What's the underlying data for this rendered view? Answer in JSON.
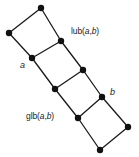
{
  "figure": {
    "background_color": "#ffffff",
    "edge_color": "#1a1a1a",
    "node_color": "#111111",
    "node_radius": 3.2,
    "edge_width": 1.3
  },
  "labels": {
    "lub": {
      "prefix": "lub(",
      "var1": "a",
      "sep": ",",
      "var2": "b",
      "suffix": ")",
      "full": "lub(a,b)"
    },
    "glb": {
      "prefix": "glb(",
      "var1": "a",
      "sep": ",",
      "var2": "b",
      "suffix": ")",
      "full": "glb(a,b)"
    },
    "a": {
      "text": "a"
    },
    "b": {
      "text": "b"
    }
  },
  "chart_data": {
    "type": "diagram",
    "subtype": "hasse-lattice",
    "title": "",
    "nodes": [
      {
        "id": "top",
        "x": 41,
        "y": 8,
        "label": ""
      },
      {
        "id": "upleft",
        "x": 9,
        "y": 33,
        "label": ""
      },
      {
        "id": "lub",
        "x": 61,
        "y": 41,
        "label": "lub(a,b)"
      },
      {
        "id": "a",
        "x": 32,
        "y": 58,
        "label": "a"
      },
      {
        "id": "midright",
        "x": 83,
        "y": 70,
        "label": ""
      },
      {
        "id": "midleft",
        "x": 55,
        "y": 89,
        "label": ""
      },
      {
        "id": "b",
        "x": 102,
        "y": 97,
        "label": "b"
      },
      {
        "id": "glb",
        "x": 78,
        "y": 118,
        "label": "glb(a,b)"
      },
      {
        "id": "right",
        "x": 128,
        "y": 127,
        "label": ""
      },
      {
        "id": "bottom",
        "x": 100,
        "y": 150,
        "label": ""
      }
    ],
    "edges": [
      [
        "top",
        "upleft"
      ],
      [
        "top",
        "lub"
      ],
      [
        "upleft",
        "a"
      ],
      [
        "lub",
        "a"
      ],
      [
        "lub",
        "midright"
      ],
      [
        "a",
        "midleft"
      ],
      [
        "midright",
        "midleft"
      ],
      [
        "midright",
        "b"
      ],
      [
        "midleft",
        "glb"
      ],
      [
        "b",
        "glb"
      ],
      [
        "b",
        "right"
      ],
      [
        "glb",
        "bottom"
      ],
      [
        "right",
        "bottom"
      ]
    ],
    "xlabel": "",
    "ylabel": "",
    "grid": false,
    "legend": false
  }
}
